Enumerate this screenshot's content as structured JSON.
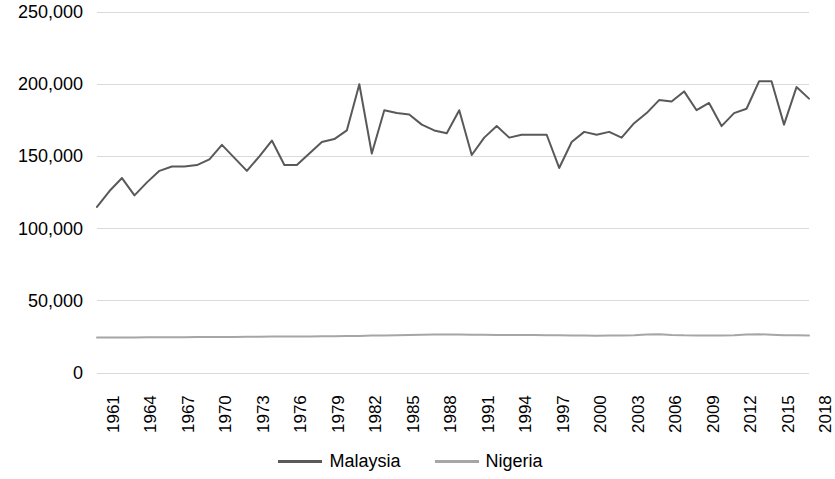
{
  "chart_data": {
    "type": "line",
    "title": "",
    "xlabel": "",
    "ylabel": "",
    "ylim": [
      0,
      250000
    ],
    "yticks": [
      0,
      50000,
      100000,
      150000,
      200000,
      250000
    ],
    "ytick_labels": [
      "0",
      "50,000",
      "100,000",
      "150,000",
      "200,000",
      "250,000"
    ],
    "grid": true,
    "legend_position": "bottom",
    "x": [
      1961,
      1962,
      1963,
      1964,
      1965,
      1966,
      1967,
      1968,
      1969,
      1970,
      1971,
      1972,
      1973,
      1974,
      1975,
      1976,
      1977,
      1978,
      1979,
      1980,
      1981,
      1982,
      1983,
      1984,
      1985,
      1986,
      1987,
      1988,
      1989,
      1990,
      1991,
      1992,
      1993,
      1994,
      1995,
      1996,
      1997,
      1998,
      1999,
      2000,
      2001,
      2002,
      2003,
      2004,
      2005,
      2006,
      2007,
      2008,
      2009,
      2010,
      2011,
      2012,
      2013,
      2014,
      2015,
      2016,
      2017,
      2018
    ],
    "xtick_labels": [
      "1961",
      "1964",
      "1967",
      "1970",
      "1973",
      "1976",
      "1979",
      "1982",
      "1985",
      "1988",
      "1991",
      "1994",
      "1997",
      "2000",
      "2003",
      "2006",
      "2009",
      "2012",
      "2015",
      "2018"
    ],
    "xtick_values": [
      1961,
      1964,
      1967,
      1970,
      1973,
      1976,
      1979,
      1982,
      1985,
      1988,
      1991,
      1994,
      1997,
      2000,
      2003,
      2006,
      2009,
      2012,
      2015,
      2018
    ],
    "series": [
      {
        "name": "Malaysia",
        "color": "#595959",
        "values": [
          115000,
          126000,
          135000,
          123000,
          132000,
          140000,
          143000,
          143000,
          144000,
          148000,
          158000,
          149000,
          140000,
          150000,
          161000,
          144000,
          144000,
          152000,
          160000,
          162000,
          168000,
          200000,
          152000,
          182000,
          180000,
          179000,
          172000,
          168000,
          166000,
          182000,
          151000,
          163000,
          171000,
          163000,
          165000,
          165000,
          165000,
          142000,
          160000,
          167000,
          165000,
          167000,
          163000,
          173000,
          180000,
          189000,
          188000,
          195000,
          182000,
          187000,
          171000,
          180000,
          183000,
          202000,
          202000,
          172000,
          198000,
          190000
        ]
      },
      {
        "name": "Nigeria",
        "color": "#a6a6a6",
        "values": [
          24500,
          24500,
          24600,
          24600,
          24700,
          24700,
          24800,
          24800,
          24900,
          24900,
          25000,
          25000,
          25100,
          25100,
          25200,
          25200,
          25300,
          25300,
          25400,
          25500,
          25600,
          25700,
          25900,
          26000,
          26200,
          26400,
          26500,
          26600,
          26600,
          26600,
          26500,
          26500,
          26400,
          26400,
          26300,
          26300,
          26200,
          26200,
          26000,
          25900,
          25800,
          25900,
          26000,
          26100,
          26600,
          26900,
          26400,
          26100,
          26000,
          26000,
          26000,
          26100,
          26700,
          26900,
          26500,
          26200,
          26100,
          26000
        ]
      }
    ]
  },
  "legend": {
    "entries": [
      {
        "label": "Malaysia"
      },
      {
        "label": "Nigeria"
      }
    ]
  }
}
